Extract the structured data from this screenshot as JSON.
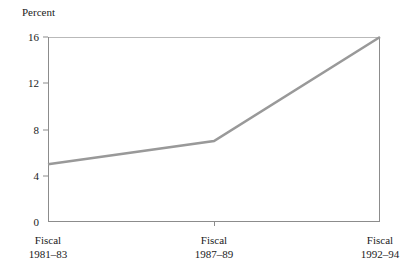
{
  "chart_data": {
    "type": "line",
    "title": "",
    "ylabel": "Percent",
    "xlabel": "",
    "categories": [
      "Fiscal\n1981–83",
      "Fiscal\n1987–89",
      "Fiscal\n1992–94"
    ],
    "x_tick_labels": [
      {
        "line1": "Fiscal",
        "line2": "1981–83"
      },
      {
        "line1": "Fiscal",
        "line2": "1987–89"
      },
      {
        "line1": "Fiscal",
        "line2": "1992–94"
      }
    ],
    "values": [
      5,
      7,
      16
    ],
    "ylim": [
      0,
      16
    ],
    "y_ticks": [
      0,
      4,
      8,
      12,
      16
    ],
    "y_tick_labels": [
      "0",
      "4",
      "8",
      "12",
      "16"
    ],
    "grid": false,
    "legend": null,
    "series": [
      {
        "name": "Percent",
        "values": [
          5,
          7,
          16
        ],
        "color": "#999999"
      }
    ],
    "line_color": "#999999",
    "axis_color": "#8c8c8c",
    "background_color": "#ffffff",
    "text_color": "#1a1a1a"
  }
}
